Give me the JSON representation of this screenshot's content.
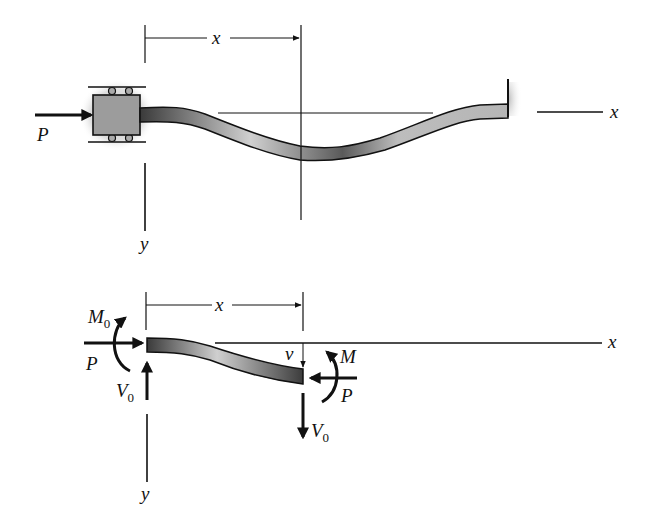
{
  "diagram": {
    "type": "column buckling free-body diagram",
    "top_figure": {
      "description": "Column with roller-guided sliding block at left, fixed wall at right, buckled deflected shape",
      "labels": {
        "load": "P",
        "dimension": "x",
        "axis_x": "x",
        "axis_y": "y"
      }
    },
    "bottom_figure": {
      "description": "Free-body diagram of column segment of length x",
      "labels": {
        "left_moment": "M",
        "left_moment_sub": "0",
        "left_load": "P",
        "left_shear": "V",
        "left_shear_sub": "0",
        "dimension": "x",
        "deflection": "v",
        "right_moment": "M",
        "right_load": "P",
        "right_shear": "V",
        "right_shear_sub": "0",
        "axis_x": "x",
        "axis_y": "y"
      }
    },
    "colors": {
      "line": "#111111",
      "beam_fill_light": "#d8d8d8",
      "beam_fill_dark": "#4a4a4a",
      "block_fill": "#9a9a9a",
      "halo": "#bdbdbd"
    }
  }
}
